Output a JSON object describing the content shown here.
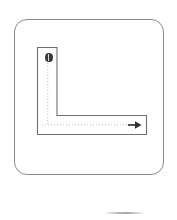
{
  "figure": {
    "background_color": "#ffffff"
  },
  "outer_frame": {
    "name": "rounded-square-boundary",
    "stroke_color": "#8a8a8e",
    "fill_color": "#ffffff",
    "corner_radius": 13,
    "x": 14,
    "y": 19,
    "width": 150,
    "height": 156
  },
  "corridor": {
    "name": "l-shaped-corridor",
    "stroke_color": "#6f6f74",
    "fill_color": "#ffffff",
    "shape": "L",
    "vertical_arm": {
      "x": 37,
      "y": 47,
      "width": 20,
      "height": 88
    },
    "horizontal_arm": {
      "x": 37,
      "y": 115,
      "width": 110,
      "height": 20
    }
  },
  "path": {
    "name": "dotted-travel-path",
    "stroke_color": "#b9b9bd",
    "style": "dotted",
    "start_point": {
      "x": 48,
      "y": 57
    },
    "corner_point": {
      "x": 48,
      "y": 125
    },
    "end_point": {
      "x": 138,
      "y": 125
    }
  },
  "start_marker": {
    "name": "start-position-marker",
    "color": "#3a3a3a",
    "highlight_color": "#d8d8d8",
    "x": 48,
    "y": 57,
    "label": ""
  },
  "arrow": {
    "name": "direction-arrow",
    "color": "#2f2f2f",
    "direction": "right",
    "tip_x": 141,
    "tip_y": 125
  },
  "bottom_shadow": {
    "name": "bottom-shadow-line",
    "color": "#b6b6b8",
    "x": 104,
    "y": 212,
    "width": 42
  }
}
